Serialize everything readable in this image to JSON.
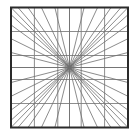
{
  "diagram": {
    "type": "geometric-star-grid",
    "canvas": {
      "width": 135,
      "height": 137
    },
    "frame": {
      "x0": 11,
      "y0": 7.5,
      "x1": 128,
      "y1": 127.5
    },
    "center_fraction": [
      0.5,
      0.5
    ],
    "grid_fractions": [
      0.2,
      0.4,
      0.5,
      0.6,
      0.8
    ],
    "ray_edge_fractions": [
      0,
      0.06,
      0.145,
      0.26,
      0.375,
      0.5,
      0.625,
      0.74,
      0.855,
      0.94,
      1
    ],
    "colors": {
      "background": "#ffffff",
      "frame": "#2b2b2b",
      "grid": "#808080",
      "rays": "#6e6e6e"
    },
    "stroke_widths": {
      "frame": 2,
      "grid": 0.9,
      "rays": 0.8
    }
  }
}
